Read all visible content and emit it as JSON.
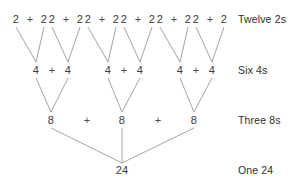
{
  "diagram": {
    "line_color": "#9a9a9a",
    "text_color": "#3a3a3a",
    "background": "#ffffff",
    "plus_symbol": "+",
    "levels": [
      {
        "id": "level-twos",
        "label": "Twelve 2s",
        "label_x": 238,
        "y": 19,
        "nodes": [
          {
            "value": "2",
            "x": 16
          },
          {
            "value": "2",
            "x": 44
          },
          {
            "value": "2",
            "x": 52
          },
          {
            "value": "2",
            "x": 80
          },
          {
            "value": "2",
            "x": 88
          },
          {
            "value": "2",
            "x": 116
          },
          {
            "value": "2",
            "x": 124
          },
          {
            "value": "2",
            "x": 152
          },
          {
            "value": "2",
            "x": 160
          },
          {
            "value": "2",
            "x": 188
          },
          {
            "value": "2",
            "x": 196
          },
          {
            "value": "2",
            "x": 224
          }
        ],
        "operators": [
          {
            "symbol": "+",
            "x": 30
          },
          {
            "symbol": "+",
            "x": 66
          },
          {
            "symbol": "+",
            "x": 102
          },
          {
            "symbol": "+",
            "x": 138
          },
          {
            "symbol": "+",
            "x": 174
          },
          {
            "symbol": "+",
            "x": 210
          }
        ]
      },
      {
        "id": "level-fours",
        "label": "Six 4s",
        "label_x": 238,
        "y": 70,
        "nodes": [
          {
            "value": "4",
            "x": 36
          },
          {
            "value": "4",
            "x": 68
          },
          {
            "value": "4",
            "x": 108
          },
          {
            "value": "4",
            "x": 140
          },
          {
            "value": "4",
            "x": 180
          },
          {
            "value": "4",
            "x": 212
          }
        ],
        "operators": [
          {
            "symbol": "+",
            "x": 52
          },
          {
            "symbol": "+",
            "x": 124
          },
          {
            "symbol": "+",
            "x": 196
          }
        ]
      },
      {
        "id": "level-eights",
        "label": "Three 8s",
        "label_x": 238,
        "y": 120,
        "nodes": [
          {
            "value": "8",
            "x": 51
          },
          {
            "value": "8",
            "x": 122
          },
          {
            "value": "8",
            "x": 194
          }
        ],
        "operators": [
          {
            "symbol": "+",
            "x": 87
          },
          {
            "symbol": "+",
            "x": 158
          }
        ]
      },
      {
        "id": "level-total",
        "label": "One 24",
        "label_x": 238,
        "y": 170,
        "nodes": [
          {
            "value": "24",
            "x": 122
          }
        ],
        "operators": []
      }
    ],
    "edges": [
      {
        "x1": 16,
        "y1": 27,
        "x2": 36,
        "y2": 62
      },
      {
        "x1": 44,
        "y1": 27,
        "x2": 36,
        "y2": 62
      },
      {
        "x1": 52,
        "y1": 27,
        "x2": 68,
        "y2": 62
      },
      {
        "x1": 80,
        "y1": 27,
        "x2": 68,
        "y2": 62
      },
      {
        "x1": 88,
        "y1": 27,
        "x2": 108,
        "y2": 62
      },
      {
        "x1": 116,
        "y1": 27,
        "x2": 108,
        "y2": 62
      },
      {
        "x1": 124,
        "y1": 27,
        "x2": 140,
        "y2": 62
      },
      {
        "x1": 152,
        "y1": 27,
        "x2": 140,
        "y2": 62
      },
      {
        "x1": 160,
        "y1": 27,
        "x2": 180,
        "y2": 62
      },
      {
        "x1": 188,
        "y1": 27,
        "x2": 180,
        "y2": 62
      },
      {
        "x1": 196,
        "y1": 27,
        "x2": 212,
        "y2": 62
      },
      {
        "x1": 224,
        "y1": 27,
        "x2": 212,
        "y2": 62
      },
      {
        "x1": 36,
        "y1": 78,
        "x2": 51,
        "y2": 112
      },
      {
        "x1": 68,
        "y1": 78,
        "x2": 51,
        "y2": 112
      },
      {
        "x1": 108,
        "y1": 78,
        "x2": 122,
        "y2": 112
      },
      {
        "x1": 140,
        "y1": 78,
        "x2": 122,
        "y2": 112
      },
      {
        "x1": 180,
        "y1": 78,
        "x2": 194,
        "y2": 112
      },
      {
        "x1": 212,
        "y1": 78,
        "x2": 194,
        "y2": 112
      },
      {
        "x1": 51,
        "y1": 128,
        "x2": 122,
        "y2": 163
      },
      {
        "x1": 122,
        "y1": 128,
        "x2": 122,
        "y2": 163
      },
      {
        "x1": 194,
        "y1": 128,
        "x2": 122,
        "y2": 163
      }
    ]
  }
}
